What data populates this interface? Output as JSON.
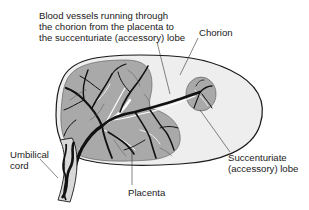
{
  "figure": {
    "colors": {
      "background": "#ffffff",
      "chorion": "#eeeeee",
      "placenta": "#a9a9a9",
      "vessels": "#111111",
      "veins": "#ffffff",
      "outline": "#1a1a1a",
      "label_text": "#1a1a1a"
    },
    "labels": {
      "vessels": {
        "lines": [
          "Blood vessels running through",
          "the chorion from the placenta to",
          "the succenturiate (accessory) lobe"
        ]
      },
      "chorion": {
        "lines": [
          "Chorion"
        ]
      },
      "succenturiate_lobe": {
        "lines": [
          "Succenturiate",
          "(accessory) lobe"
        ]
      },
      "umbilical_cord": {
        "lines": [
          "Umbilical",
          "cord"
        ]
      },
      "placenta": {
        "lines": [
          "Placenta"
        ]
      }
    }
  }
}
